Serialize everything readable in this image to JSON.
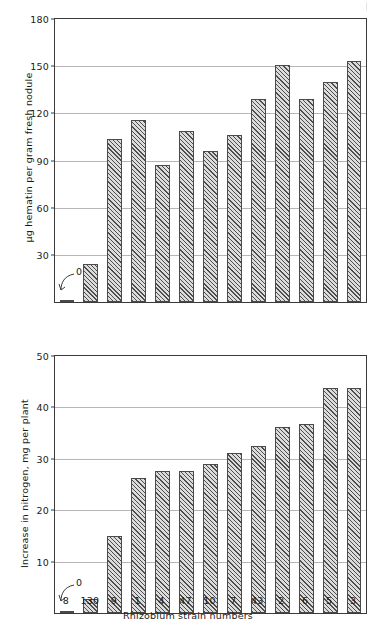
{
  "figure": {
    "xlabel": "Rhizobium strain numbers",
    "strains": [
      "8",
      "130",
      "9",
      "1",
      "4",
      "47",
      "10",
      "7",
      "43",
      "2",
      "6",
      "5",
      "3"
    ],
    "zero_callout_label": "0"
  },
  "chart_data": [
    {
      "type": "bar",
      "title": "",
      "xlabel": "Rhizobium strain numbers",
      "ylabel": "µg hematin per gram fresh nodule",
      "categories": [
        "8",
        "130",
        "9",
        "1",
        "4",
        "47",
        "10",
        "7",
        "43",
        "2",
        "6",
        "5",
        "3"
      ],
      "values": [
        0,
        24,
        104,
        116,
        87,
        109,
        96,
        106,
        129,
        151,
        129,
        140,
        153
      ],
      "yticks": [
        30,
        60,
        90,
        120,
        150,
        180
      ],
      "ylim": [
        0,
        180
      ],
      "grid": true,
      "legend": "none",
      "annotations": [
        {
          "text": "0",
          "target_category": "8",
          "note": "leader line points to zero-height bar for strain 8"
        }
      ]
    },
    {
      "type": "bar",
      "title": "",
      "xlabel": "Rhizobium strain numbers",
      "ylabel": "Increase in nitrogen, mg per plant",
      "categories": [
        "8",
        "130",
        "9",
        "1",
        "4",
        "47",
        "10",
        "7",
        "43",
        "2",
        "6",
        "5",
        "3"
      ],
      "values": [
        0,
        2.8,
        15.0,
        26.3,
        27.6,
        27.6,
        29.0,
        31.1,
        32.5,
        36.1,
        36.7,
        43.7,
        43.7
      ],
      "yticks": [
        10,
        20,
        30,
        40,
        50
      ],
      "ylim": [
        0,
        50
      ],
      "grid": true,
      "legend": "none",
      "annotations": [
        {
          "text": "0",
          "target_category": "8",
          "note": "leader line points to zero-height bar for strain 8"
        }
      ]
    }
  ],
  "style": {
    "bar_fill": "#dcdcdc",
    "bar_edge": "#4a4a4a",
    "grid_color": "#b6b6b6",
    "axis_color": "#3a3a3a",
    "text_color": "#1a1a1a",
    "background": "#ffffff",
    "bar_hatch": "diagonal-45"
  }
}
